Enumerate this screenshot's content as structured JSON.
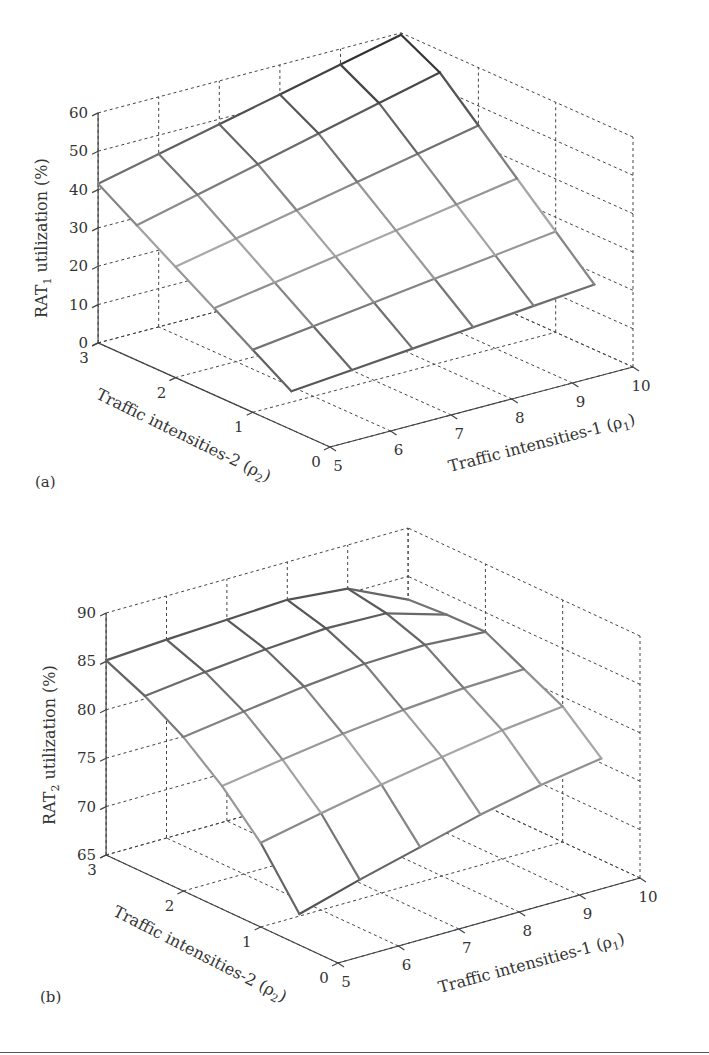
{
  "figure": {
    "panels": [
      "(a)",
      "(b)"
    ]
  },
  "chart_data": [
    {
      "type": "surface",
      "panel_label": "(a)",
      "title": "",
      "xlabel": "Traffic intensities-1 (ρ1)",
      "ylabel": "Traffic intensities-2 (ρ2)",
      "zlabel": "RAT1 utilization (%)",
      "x_ticks": [
        5,
        6,
        7,
        8,
        9,
        10
      ],
      "y_ticks": [
        0,
        1,
        2,
        3
      ],
      "z_ticks": [
        0,
        10,
        20,
        30,
        40,
        50,
        60
      ],
      "xlim": [
        5,
        10
      ],
      "ylim": [
        0,
        3
      ],
      "zlim": [
        0,
        60
      ],
      "grid": true,
      "x": [
        5,
        6,
        7,
        8,
        9,
        10
      ],
      "y": [
        0.5,
        1.0,
        1.5,
        2.0,
        2.5,
        3.0
      ],
      "z": [
        [
          10.0,
          11.4,
          12.8,
          14.2,
          15.6,
          17.0
        ],
        [
          16.3,
          18.3,
          20.3,
          22.3,
          24.3,
          26.3
        ],
        [
          22.6,
          25.2,
          27.8,
          30.4,
          33.0,
          35.6
        ],
        [
          28.9,
          32.1,
          35.3,
          38.5,
          41.7,
          44.9
        ],
        [
          35.2,
          39.0,
          42.8,
          46.6,
          50.4,
          54.2
        ],
        [
          41.5,
          45.1,
          48.7,
          52.3,
          55.9,
          59.5
        ]
      ]
    },
    {
      "type": "surface",
      "panel_label": "(b)",
      "title": "",
      "xlabel": "Traffic intensities-1 (ρ1)",
      "ylabel": "Traffic intensities-2 (ρ2)",
      "zlabel": "RAT2 utilization (%)",
      "x_ticks": [
        5,
        6,
        7,
        8,
        9,
        10
      ],
      "y_ticks": [
        0,
        1,
        2,
        3
      ],
      "z_ticks": [
        65,
        70,
        75,
        80,
        85,
        90
      ],
      "xlim": [
        5,
        10
      ],
      "ylim": [
        0,
        3
      ],
      "zlim": [
        65,
        90
      ],
      "grid": true,
      "x": [
        5,
        6,
        7,
        8,
        9,
        10
      ],
      "y": [
        0.5,
        1.0,
        1.5,
        2.0,
        2.5,
        3.0
      ],
      "z": [
        [
          68.2,
          70.0,
          71.6,
          73.2,
          74.5,
          75.5
        ],
        [
          73.7,
          75.0,
          76.2,
          77.3,
          78.3,
          79.0
        ],
        [
          77.7,
          78.7,
          79.6,
          80.3,
          80.8,
          81.0
        ],
        [
          80.9,
          81.8,
          82.6,
          83.2,
          83.4,
          83.0
        ],
        [
          83.3,
          84.0,
          84.6,
          85.0,
          84.8,
          82.9
        ],
        [
          85.1,
          85.5,
          85.8,
          86.1,
          85.5,
          82.6
        ]
      ]
    }
  ],
  "labels": {
    "a": {
      "z_axis_prefix": "RAT",
      "z_axis_sub": "1",
      "z_axis_suffix": " utilization (%)",
      "x_axis_main": "Traffic intensities-1 (ρ",
      "x_axis_sub": "1",
      "x_axis_end": ")",
      "y_axis_main": "Traffic intensities-2 (ρ",
      "y_axis_sub": "2",
      "y_axis_end": ")",
      "panel": "(a)"
    },
    "b": {
      "z_axis_prefix": "RAT",
      "z_axis_sub": "2",
      "z_axis_suffix": " utilization (%)",
      "x_axis_main": "Traffic intensities-1 (ρ",
      "x_axis_sub": "1",
      "x_axis_end": ")",
      "y_axis_main": "Traffic intensities-2 (ρ",
      "y_axis_sub": "2",
      "y_axis_end": ")",
      "panel": "(b)"
    }
  },
  "geometry": [
    {
      "origin": [
        330,
        447
      ],
      "dx": [
        60.6,
        -16.0
      ],
      "dy": [
        -77.3,
        -34.7
      ],
      "zpx": 3.833,
      "zmin": 0
    },
    {
      "origin": [
        338,
        963
      ],
      "dx": [
        60.4,
        -17.0
      ],
      "dy": [
        -77.3,
        -36.0
      ],
      "zpx": 9.68,
      "zmin": 65
    }
  ]
}
